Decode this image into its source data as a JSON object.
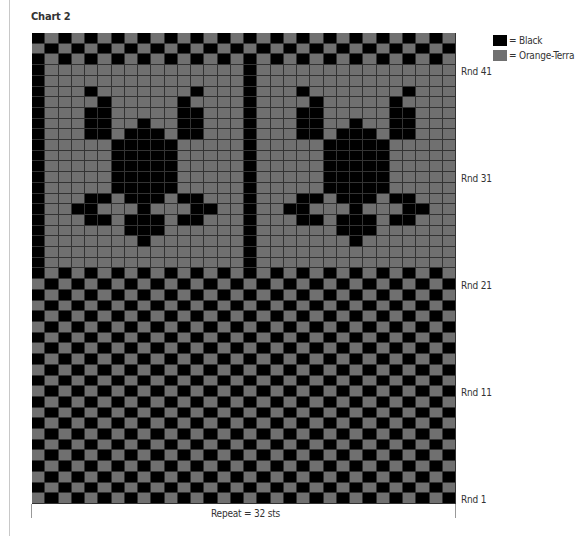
{
  "chart_title": "Chart 2",
  "legend": [
    {
      "label": "= Black",
      "color": "#000000"
    },
    {
      "label": "= Orange-Terra",
      "color": "#707070"
    }
  ],
  "round_labels": [
    {
      "label": "Rnd 41",
      "round": 41
    },
    {
      "label": "Rnd 31",
      "round": 31
    },
    {
      "label": "Rnd 21",
      "round": 21
    },
    {
      "label": "Rnd 11",
      "round": 11
    },
    {
      "label": "Rnd 1",
      "round": 1
    }
  ],
  "repeat_label": "Repeat = 32 sts",
  "grid": {
    "columns": 32,
    "rounds": 44,
    "legend_key": {
      "B": "Black",
      "G": "Orange-Terra"
    },
    "rows_top_to_bottom": [
      "BGBGBGBGBGBGBGBGBGBGBGBGBGBGBGBG",
      "GBGBGBGBGBGBGBGBGBGBGBGBGBGBGBGB",
      "BGBGBGBGBGBGBGBGBGBGBGBGBGBGBGBG",
      "BGGGGGGGGGGGGGGGBGGGGGGGGGGGGGGG",
      "BGGGGGGGGGGGGGGGBGGGGGGGGGGGGGGG",
      "BGGGBGGGGGGGBGGGBGGGBGGGGGGGBGGG",
      "BGGGGBGGGGGBGGGGBGGGGBGGGGGBGGGG",
      "BGGGBBGGGGGBBGGGBGGGBBGGGGGBBGGG",
      "BGGGBBGGBGGBBGGGBGGGBBGGBGGBBGGG",
      "BGGGBBGBBBGBBGGGBGGGBBGBBBGBBGGG",
      "BGGGGGBBBBBGGGGGBGGGGGBBBBBGGGGG",
      "BGGGGGBBBBBGGGGGBGGGGGBBBBBGGGGG",
      "BGGGGGBBBBBGGGGGBGGGGGBBBBBGGGGG",
      "BGGGGGBBBBBGGGGGBGGGGGBBBBBGGGGG",
      "BGGGGGBBBBBGGGGGBGGGGGBBBBBGGGGG",
      "BGGGBBGBBBGBBGGGBGGGBBGBBBGBBGGG",
      "BGGBBGGGBGGGBBGGBGGBBGGGBGGGBBGG",
      "BGGGBBGBBBGBBGGGBGGGBBGBBBGBBGGG",
      "BGGGGGGBBBGGGGGGBGGGGGGBBBGGGGGG",
      "BGGGGGGGBGGGGGGGBGGGGGGGBGGGGGGG",
      "BGGGGGGGGGGGGGGGBGGGGGGGGGGGGGGG",
      "BGGGGGGGGGGGGGGGBGGGGGGGGGGGGGGG",
      "BGBGBGBGBGBGBGBGBGBGBGBGBGBGBGBG",
      "GBGBGBGBGBGBGBGBGBGBGBGBGBGBGBGB",
      "BGBGBGBGBGBGBGBGBGBGBGBGBGBGBGBG",
      "GBGBGBGBGBGBGBGBGBGBGBGBGBGBGBGB",
      "BGBGBGBGBGBGBGBGBGBGBGBGBGBGBGBG",
      "GBGBGBGBGBGBGBGBGBGBGBGBGBGBGBGB",
      "BGBGBGBGBGBGBGBGBGBGBGBGBGBGBGBG",
      "GBGBGBGBGBGBGBGBGBGBGBGBGBGBGBGB",
      "BGBGBGBGBGBGBGBGBGBGBGBGBGBGBGBG",
      "GBGBGBGBGBGBGBGBGBGBGBGBGBGBGBGB",
      "BGBGBGBGBGBGBGBGBGBGBGBGBGBGBGBG",
      "GBGBGBGBGBGBGBGBGBGBGBGBGBGBGBGB",
      "BGBGBGBGBGBGBGBGBGBGBGBGBGBGBGBG",
      "GBGBGBGBGBGBGBGBGBGBGBGBGBGBGBGB",
      "BGBGBGBGBGBGBGBGBGBGBGBGBGBGBGBG",
      "GBGBGBGBGBGBGBGBGBGBGBGBGBGBGBGB",
      "BGBGBGBGBGBGBGBGBGBGBGBGBGBGBGBG",
      "GBGBGBGBGBGBGBGBGBGBGBGBGBGBGBGB",
      "BGBGBGBGBGBGBGBGBGBGBGBGBGBGBGBG",
      "GBGBGBGBGBGBGBGBGBGBGBGBGBGBGBGB",
      "BGBGBGBGBGBGBGBGBGBGBGBGBGBGBGBG",
      "GBGBGBGBGBGBGBGBGBGBGBGBGBGBGBGB"
    ]
  }
}
